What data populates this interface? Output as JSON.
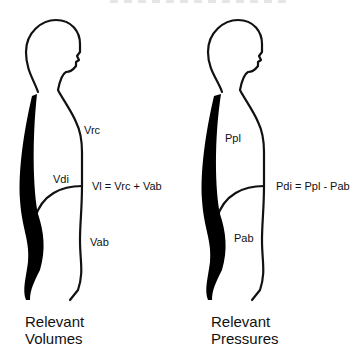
{
  "diagram": {
    "left_figure": {
      "labels": {
        "rib_cage": "Vrc",
        "diaphragm": "Vdi",
        "abdomen": "Vab",
        "equation": "Vl = Vrc + Vab"
      },
      "caption_line1": "Relevant",
      "caption_line2": "Volumes"
    },
    "right_figure": {
      "labels": {
        "pleural": "Ppl",
        "abdominal": "Pab",
        "equation": "Pdi = Ppl - Pab"
      },
      "caption_line1": "Relevant",
      "caption_line2": "Pressures"
    },
    "colors": {
      "outline": "#111111",
      "spine": "#000000",
      "background": "#ffffff"
    }
  }
}
